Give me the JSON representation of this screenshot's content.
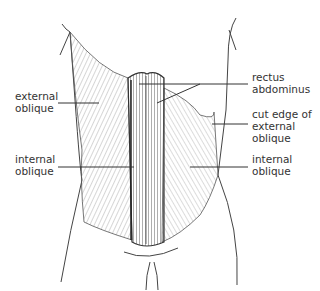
{
  "diagram": {
    "labels": {
      "external_oblique_left": "external\noblique",
      "internal_oblique_left": "internal\noblique",
      "rectus_abdominus": "rectus\nabdominus",
      "cut_edge": "cut edge of\nexternal\noblique",
      "internal_oblique_right": "internal\noblique"
    },
    "colors": {
      "line": "#333333",
      "hatch": "#777777",
      "background": "#ffffff"
    }
  }
}
